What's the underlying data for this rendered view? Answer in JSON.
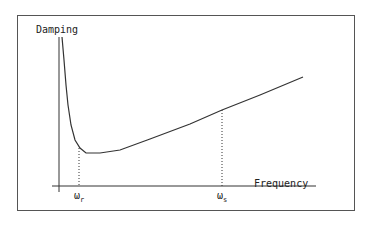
{
  "chart_data": {
    "type": "line",
    "title": "",
    "xlabel": "Frequency",
    "ylabel": "Damping",
    "x_ticks": [
      {
        "label": "ω",
        "sub": "r",
        "position_px": 79
      },
      {
        "label": "ω",
        "sub": "s",
        "position_px": 222
      }
    ],
    "series": [
      {
        "name": "Damping vs Frequency",
        "points_px": [
          [
            62,
            37
          ],
          [
            64,
            60
          ],
          [
            66,
            85
          ],
          [
            68,
            105
          ],
          [
            71,
            125
          ],
          [
            75,
            140
          ],
          [
            80,
            148
          ],
          [
            86,
            153
          ],
          [
            100,
            153
          ],
          [
            120,
            150
          ],
          [
            150,
            139
          ],
          [
            190,
            124
          ],
          [
            222,
            110
          ],
          [
            260,
            95
          ],
          [
            303,
            77
          ]
        ]
      }
    ],
    "reference_lines": [
      {
        "x_px": 79,
        "from_y_px": 148,
        "to_y_px": 186,
        "style": "dotted"
      },
      {
        "x_px": 222,
        "from_y_px": 110,
        "to_y_px": 186,
        "style": "dotted"
      }
    ],
    "grid": false,
    "legend": "none"
  },
  "labels": {
    "y_axis": "Damping",
    "x_axis": "Frequency",
    "tick_r_main": "ω",
    "tick_r_sub": "r",
    "tick_s_main": "ω",
    "tick_s_sub": "s"
  },
  "colors": {
    "line": "#333333",
    "frame": "#555555",
    "background": "#ffffff"
  }
}
